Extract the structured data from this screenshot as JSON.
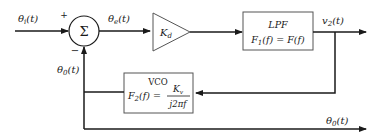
{
  "diagram": {
    "signals": {
      "input": "θi(t)",
      "error": "θe(t)",
      "lpf_output": "v2(t)",
      "feedback": "θ0(t)",
      "output": "θ0(t)"
    },
    "summer": {
      "symbol": "Σ",
      "plus_sign": "+",
      "minus_sign": "−"
    },
    "phase_detector_gain": {
      "label": "Kd"
    },
    "lpf_block": {
      "name": "LPF",
      "transfer": "F1(f) = F(f)"
    },
    "vco_block": {
      "name": "VCO",
      "transfer_lhs": "F2(f) =",
      "numerator": "Kv",
      "denominator": "j2πf"
    },
    "colors": {
      "line": "#1a1a1a",
      "box_border": "#555555",
      "background": "#ffffff"
    }
  }
}
